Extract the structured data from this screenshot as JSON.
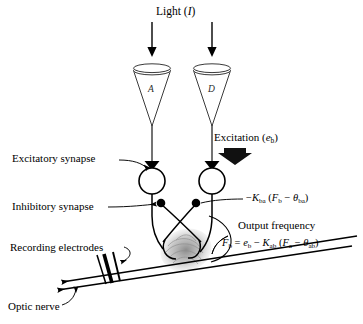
{
  "figure": {
    "title": "Light (I)",
    "title_symbol": "I",
    "title_text": "Light",
    "background_color": "#ffffff",
    "line_color": "#000000",
    "shading_color": "#9a9a9a"
  },
  "receptors": [
    {
      "id": "A",
      "label": "A",
      "x": 152,
      "y": 95
    },
    {
      "id": "D",
      "label": "D",
      "x": 212,
      "y": 95
    }
  ],
  "stimulus_arrows": [
    {
      "name": "light-arrow-left",
      "x": 152,
      "y_start": 20,
      "y_end": 55
    },
    {
      "name": "light-arrow-right",
      "x": 212,
      "y_start": 20,
      "y_end": 55
    }
  ],
  "labels": {
    "excitation": "Excitation (e",
    "excitation_sub": "b",
    "excitation_close": ")",
    "excitation_full": "Excitation (e_b)",
    "excitatory_synapse": "Excitatory synapse",
    "inhibitory_synapse": "Inhibitory synapse",
    "recording_electrodes": "Recording electrodes",
    "optic_nerve": "Optic nerve",
    "output_frequency": "Output frequency"
  },
  "equations": {
    "inhibition_term": "−K_ba (F_b − θ_ba)",
    "inhibition_parts": {
      "minus": "−",
      "k": "K",
      "k_sub": "ba",
      "open": "(",
      "f": "F",
      "f_sub": "b",
      "minus2": "−",
      "theta": "θ",
      "theta_sub": "ba",
      "close": ")"
    },
    "output": "F_b = e_b − K_ab (F_a − θ_ab)",
    "output_parts": {
      "lhs": "F",
      "lhs_sub": "b",
      "equals": "=",
      "e": "e",
      "e_sub": "b",
      "minus": "−",
      "k": "K",
      "k_sub": "ab",
      "open": "(",
      "f": "F",
      "f_sub": "a",
      "minus2": "−",
      "theta": "θ",
      "theta_sub": "ab",
      "close": ")"
    }
  },
  "neurons": [
    {
      "id": "soma-a",
      "cx": 152,
      "cy": 181,
      "r": 13
    },
    {
      "id": "soma-d",
      "cx": 212,
      "cy": 181,
      "r": 13
    }
  ],
  "synapse_nodes": [
    {
      "id": "inhibitory-bouton-left",
      "cx": 161,
      "cy": 203,
      "r": 4.2
    },
    {
      "id": "inhibitory-bouton-right",
      "cx": 196,
      "cy": 203,
      "r": 4.2
    }
  ]
}
